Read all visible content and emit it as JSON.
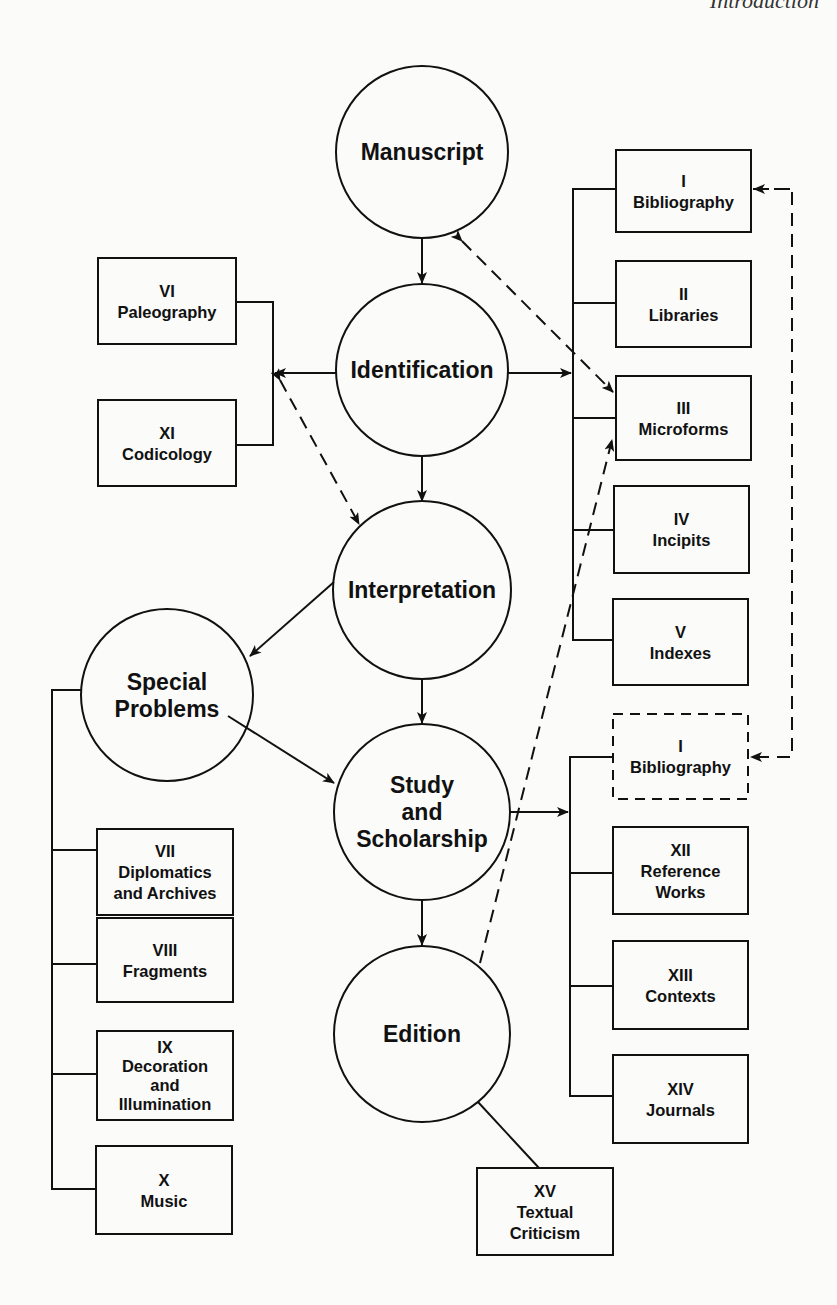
{
  "header": {
    "running_title": "Introduction"
  },
  "colors": {
    "ink": "#111111",
    "paper": "#fbfbfa"
  },
  "circles": [
    {
      "id": "manuscript",
      "cx": 422,
      "cy": 152,
      "r": 86,
      "lines": [
        "Manuscript"
      ]
    },
    {
      "id": "identification",
      "cx": 422,
      "cy": 370,
      "r": 86,
      "lines": [
        "Identification"
      ]
    },
    {
      "id": "interpretation",
      "cx": 422,
      "cy": 590,
      "r": 89,
      "lines": [
        "Interpretation"
      ]
    },
    {
      "id": "special-problems",
      "cx": 167,
      "cy": 695,
      "r": 86,
      "lines": [
        "Special",
        "Problems"
      ]
    },
    {
      "id": "study-and-scholarship",
      "cx": 422,
      "cy": 812,
      "r": 88,
      "lines": [
        "Study",
        "and",
        "Scholarship"
      ]
    },
    {
      "id": "edition",
      "cx": 422,
      "cy": 1034,
      "r": 88,
      "lines": [
        "Edition"
      ]
    }
  ],
  "boxes": [
    {
      "id": "VI",
      "x": 98,
      "y": 258,
      "w": 138,
      "h": 86,
      "lines": [
        "VI",
        "Paleography"
      ],
      "dashed": false
    },
    {
      "id": "XI",
      "x": 98,
      "y": 400,
      "w": 138,
      "h": 86,
      "lines": [
        "XI",
        "Codicology"
      ],
      "dashed": false
    },
    {
      "id": "I",
      "x": 616,
      "y": 150,
      "w": 135,
      "h": 82,
      "lines": [
        "I",
        "Bibliography"
      ],
      "dashed": false
    },
    {
      "id": "II",
      "x": 616,
      "y": 261,
      "w": 135,
      "h": 86,
      "lines": [
        "II",
        "Libraries"
      ],
      "dashed": false
    },
    {
      "id": "III",
      "x": 616,
      "y": 376,
      "w": 135,
      "h": 84,
      "lines": [
        "III",
        "Microforms"
      ],
      "dashed": false
    },
    {
      "id": "IV",
      "x": 614,
      "y": 486,
      "w": 135,
      "h": 87,
      "lines": [
        "IV",
        "Incipits"
      ],
      "dashed": false
    },
    {
      "id": "V",
      "x": 613,
      "y": 599,
      "w": 135,
      "h": 86,
      "lines": [
        "V",
        "Indexes"
      ],
      "dashed": false
    },
    {
      "id": "I-dup",
      "x": 613,
      "y": 714,
      "w": 135,
      "h": 85,
      "lines": [
        "I",
        "Bibliography"
      ],
      "dashed": true
    },
    {
      "id": "XII",
      "x": 613,
      "y": 827,
      "w": 135,
      "h": 87,
      "lines": [
        "XII",
        "Reference",
        "Works"
      ],
      "dashed": false
    },
    {
      "id": "XIII",
      "x": 613,
      "y": 941,
      "w": 135,
      "h": 88,
      "lines": [
        "XIII",
        "Contexts"
      ],
      "dashed": false
    },
    {
      "id": "XIV",
      "x": 613,
      "y": 1055,
      "w": 135,
      "h": 88,
      "lines": [
        "XIV",
        "Journals"
      ],
      "dashed": false
    },
    {
      "id": "VII",
      "x": 97,
      "y": 829,
      "w": 136,
      "h": 86,
      "lines": [
        "VII",
        "Diplomatics",
        "and Archives"
      ],
      "dashed": false
    },
    {
      "id": "VIII",
      "x": 97,
      "y": 918,
      "w": 136,
      "h": 84,
      "lines": [
        "VIII",
        "Fragments"
      ],
      "dashed": false
    },
    {
      "id": "IX",
      "x": 97,
      "y": 1031,
      "w": 136,
      "h": 89,
      "lines": [
        "IX",
        "Decoration",
        "and",
        "Illumination"
      ],
      "dashed": false
    },
    {
      "id": "X",
      "x": 96,
      "y": 1146,
      "w": 136,
      "h": 88,
      "lines": [
        "X",
        "Music"
      ],
      "dashed": false
    },
    {
      "id": "XV",
      "x": 477,
      "y": 1168,
      "w": 136,
      "h": 87,
      "lines": [
        "XV",
        "Textual",
        "Criticism"
      ],
      "dashed": false
    }
  ]
}
